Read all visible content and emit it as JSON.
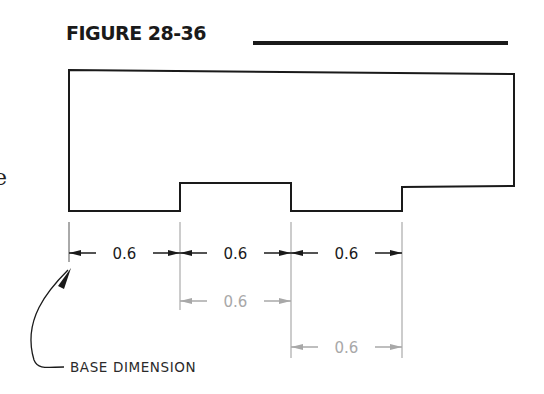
{
  "figure": {
    "title": "FIGURE 28-36",
    "margin_glyph": "e"
  },
  "dimensions": {
    "baseline_row": [
      {
        "label": "0.6",
        "style": "primary"
      },
      {
        "label": "0.6",
        "style": "primary"
      },
      {
        "label": "0.6",
        "style": "primary"
      }
    ],
    "stacked": [
      {
        "label": "0.6",
        "style": "reference"
      },
      {
        "label": "0.6",
        "style": "reference"
      }
    ]
  },
  "callout": {
    "label": "BASE DIMENSION"
  },
  "colors": {
    "primary_line": "#1a1a1a",
    "reference_line": "#a8a8a8",
    "background": "#ffffff"
  }
}
